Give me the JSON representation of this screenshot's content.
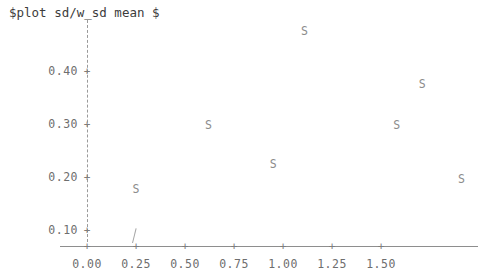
{
  "title": "$plot sd/w_sd mean $",
  "colors": {
    "background": "#ffffff",
    "axis": "#8e8e8e",
    "axis_dashed": "#9a9a9a",
    "tick_text": "#6e6e6e",
    "marker": "#8c8c8c",
    "title_text": "#3c3c3c"
  },
  "chart_data": {
    "type": "scatter",
    "title": "$plot sd/w_sd mean $",
    "xlabel": "",
    "ylabel": "",
    "marker_symbol": "S",
    "grid": false,
    "legend": null,
    "xlim": [
      0.0,
      1.99
    ],
    "ylim": [
      0.055,
      0.5
    ],
    "xticks": [
      0.0,
      0.25,
      0.5,
      0.75,
      1.0,
      1.25,
      1.5
    ],
    "xtick_labels": [
      "0.00",
      "0.25",
      "0.50",
      "0.75",
      "1.00",
      "1.25",
      "1.50"
    ],
    "yticks": [
      0.1,
      0.2,
      0.3,
      0.4
    ],
    "ytick_labels": [
      "0.10",
      "0.20",
      "0.30",
      "0.40"
    ],
    "tick_glyph": "+",
    "points": [
      {
        "x": 0.25,
        "y": 0.175,
        "label": "S"
      },
      {
        "x": 0.62,
        "y": 0.296,
        "label": "S"
      },
      {
        "x": 0.95,
        "y": 0.223,
        "label": "S"
      },
      {
        "x": 1.11,
        "y": 0.473,
        "label": "S"
      },
      {
        "x": 1.58,
        "y": 0.296,
        "label": "S"
      },
      {
        "x": 1.71,
        "y": 0.374,
        "label": "S"
      },
      {
        "x": 1.91,
        "y": 0.194,
        "label": "S"
      }
    ],
    "annotations": [
      {
        "name": "stray-tick-mark",
        "x": 0.25,
        "y": 0.105,
        "description": "short diagonal stroke above axis"
      }
    ]
  },
  "geometry": {
    "x_origin_px": 87,
    "x_unit_px": 196,
    "y_origin_px": 230,
    "y_unit_px": 530
  }
}
